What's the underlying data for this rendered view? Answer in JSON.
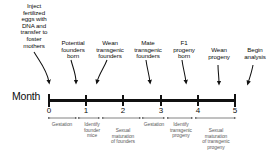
{
  "figure": {
    "axis_title": "Month",
    "tick_labels": [
      "0",
      "1",
      "2",
      "3",
      "4",
      "5"
    ],
    "colors": {
      "axis": "#111111",
      "event_text": "#0d0d0d",
      "interval_text": "#5a5a5a",
      "background": "#ffffff"
    }
  },
  "events": [
    {
      "label": "Inject\nfertilized\neggs with\nDNA and\ntransfer to\nfoster\nmothers",
      "month": "0"
    },
    {
      "label": "Potential\nfounders\nborn",
      "month": "1"
    },
    {
      "label": "Wean\ntransgenic\nfounders",
      "month": "1.5"
    },
    {
      "label": "Mate\ntransgenic\nfounders",
      "month": "2"
    },
    {
      "label": "F1\nprogeny\nborn",
      "month": "3"
    },
    {
      "label": "Wean\nprogeny",
      "month": "4"
    },
    {
      "label": "Begin\nanalysis",
      "month": "5"
    }
  ],
  "intervals": [
    {
      "label": "Gestation",
      "from": "0",
      "to": "0.75"
    },
    {
      "label": "Identify\nfounder\nmice",
      "from": "0.8",
      "to": "1.35"
    },
    {
      "label": "Sexual\nmaturation\nof founders",
      "from": "1.4",
      "to": "2.4"
    },
    {
      "label": "Gestation",
      "from": "2.45",
      "to": "3.1"
    },
    {
      "label": "Identify\ntransgenic\nprogeny",
      "from": "3.15",
      "to": "3.85"
    },
    {
      "label": "Sexual\nmaturation\nof transgenic\nprogeny",
      "from": "3.9",
      "to": "5"
    }
  ]
}
